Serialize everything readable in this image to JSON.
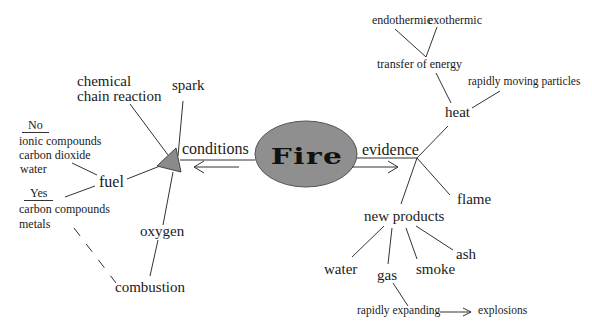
{
  "center": {
    "label": "Fire",
    "fill": "#8f8f8f"
  },
  "accent": {
    "triangle": "#8a8a8a",
    "line": "#333333"
  },
  "left": {
    "link_label": "conditions",
    "nodes": {
      "chemical_line1": "chemical",
      "chemical_line2": "chain reaction",
      "spark": "spark",
      "fuel": "fuel",
      "oxygen": "oxygen",
      "combustion": "combustion"
    },
    "fuel_no": {
      "heading": "No",
      "items": [
        "ionic compounds",
        "carbon dioxide",
        "water"
      ]
    },
    "fuel_yes": {
      "heading": "Yes",
      "items": [
        "carbon compounds",
        "metals"
      ]
    }
  },
  "right": {
    "link_label": "evidence",
    "nodes": {
      "heat": "heat",
      "transfer": "transfer of energy",
      "endothermic": "endothermic",
      "exothermic": "exothermic",
      "particles": "rapidly moving particles",
      "flame": "flame",
      "new_products": "new products",
      "water": "water",
      "gas": "gas",
      "smoke": "smoke",
      "ash": "ash",
      "expanding": "rapidly expanding",
      "explosions": "explosions"
    }
  }
}
